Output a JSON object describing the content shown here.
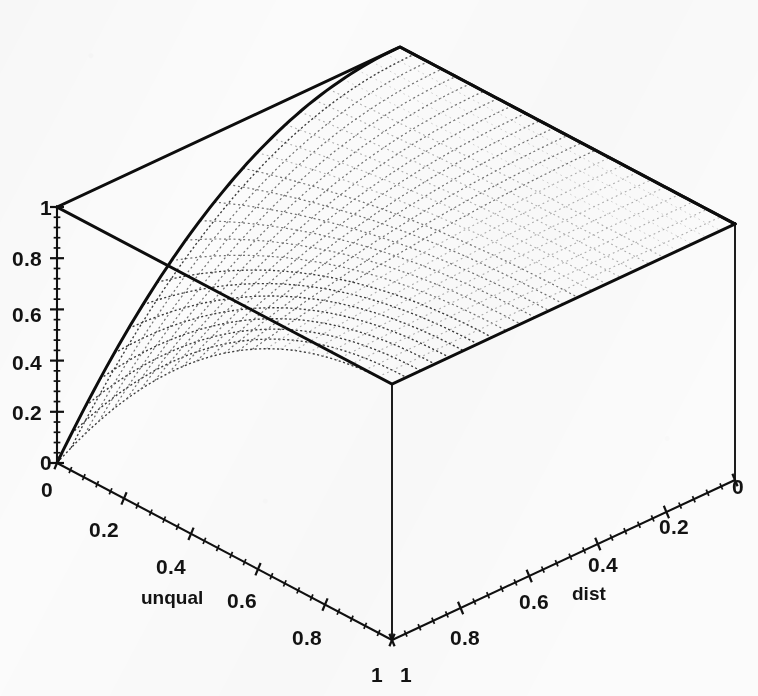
{
  "figure": {
    "kind": "3d-surface-wireframe",
    "background_color": "#fbfbfb",
    "ink_color": "#101010",
    "mesh_color": "#6f6f6f"
  },
  "chart_data": {
    "type": "surface3d",
    "title": "",
    "subtitle": "",
    "xlabel": "unqual",
    "ylabel": "dist",
    "zlabel": "",
    "grid": true,
    "legend": null,
    "legend_position": "none",
    "projection": {
      "note": "isometric-style 3D box, viewed from front above",
      "corner_top_left_px": [
        57,
        207
      ],
      "corner_top_back_px": [
        395,
        13
      ],
      "corner_top_right_px": [
        735,
        152
      ],
      "corner_top_front_px": [
        392,
        387
      ],
      "corner_bottom_left_px": [
        57,
        463
      ],
      "corner_bottom_front_px": [
        392,
        640
      ],
      "corner_bottom_right_px": [
        735,
        480
      ]
    },
    "axes": {
      "x": {
        "name": "unqual",
        "range": [
          0,
          1
        ],
        "ticks": [
          0,
          0.2,
          0.4,
          0.6,
          0.8,
          1
        ],
        "ticklabels": [
          "0",
          "0.2",
          "0.4",
          "0.6",
          "0.8",
          "1"
        ],
        "minor_ticks_per_interval": 5,
        "direction": "front-left descending"
      },
      "y": {
        "name": "dist",
        "range": [
          0,
          1
        ],
        "ticks": [
          0,
          0.2,
          0.4,
          0.6,
          0.8,
          1
        ],
        "ticklabels": [
          "0",
          "0.2",
          "0.4",
          "0.6",
          "0.8",
          "1"
        ],
        "minor_ticks_per_interval": 5,
        "direction": "front-right descending"
      },
      "z": {
        "name": "",
        "range": [
          0,
          1
        ],
        "ticks": [
          0,
          0.2,
          0.4,
          0.6,
          0.8,
          1
        ],
        "ticklabels": [
          "0",
          "0.2",
          "0.4",
          "0.6",
          "0.8",
          "1"
        ],
        "minor_ticks_per_interval": 5,
        "direction": "vertical left"
      }
    },
    "surface": {
      "description": "Surface rises sharply from 0 near the unqual=0, dist=0 corner and saturates at a plateau of 1 over most of the domain.",
      "zmin": 0,
      "zmax": 1,
      "mesh_rows": 24,
      "mesh_cols": 24,
      "z_at_corners": {
        "unqual0_dist0": 0.0,
        "unqual1_dist0": 1.0,
        "unqual0_dist1": 1.0,
        "unqual1_dist1": 1.0
      },
      "sample_grid_u": [
        0,
        0.125,
        0.25,
        0.375,
        0.5,
        0.625,
        0.75,
        0.875,
        1
      ],
      "sample_grid_v": [
        0,
        0.125,
        0.25,
        0.375,
        0.5,
        0.625,
        0.75,
        0.875,
        1
      ],
      "sample_z": [
        [
          0.0,
          0.39,
          0.63,
          0.78,
          0.87,
          0.93,
          0.96,
          0.99,
          1.0
        ],
        [
          0.39,
          0.63,
          0.78,
          0.87,
          0.92,
          0.96,
          0.98,
          0.99,
          1.0
        ],
        [
          0.63,
          0.78,
          0.87,
          0.92,
          0.95,
          0.97,
          0.99,
          1.0,
          1.0
        ],
        [
          0.78,
          0.87,
          0.92,
          0.95,
          0.97,
          0.98,
          0.99,
          1.0,
          1.0
        ],
        [
          0.87,
          0.92,
          0.95,
          0.97,
          0.98,
          0.99,
          1.0,
          1.0,
          1.0
        ],
        [
          0.93,
          0.96,
          0.97,
          0.98,
          0.99,
          0.99,
          1.0,
          1.0,
          1.0
        ],
        [
          0.96,
          0.98,
          0.99,
          0.99,
          1.0,
          1.0,
          1.0,
          1.0,
          1.0
        ],
        [
          0.99,
          0.99,
          1.0,
          1.0,
          1.0,
          1.0,
          1.0,
          1.0,
          1.0
        ],
        [
          1.0,
          1.0,
          1.0,
          1.0,
          1.0,
          1.0,
          1.0,
          1.0,
          1.0
        ]
      ]
    }
  },
  "labels": {
    "z_axis": [
      {
        "text": "1",
        "x": 40,
        "y": 215
      },
      {
        "text": "0.8",
        "x": 12,
        "y": 266
      },
      {
        "text": "0.6",
        "x": 12,
        "y": 322
      },
      {
        "text": "0.4",
        "x": 12,
        "y": 370
      },
      {
        "text": "0.2",
        "x": 12,
        "y": 420
      },
      {
        "text": "0",
        "x": 40,
        "y": 470
      }
    ],
    "x_axis": [
      {
        "text": "0",
        "x": 41,
        "y": 497
      },
      {
        "text": "0.2",
        "x": 89,
        "y": 537
      },
      {
        "text": "0.4",
        "x": 156,
        "y": 574
      },
      {
        "text": "0.6",
        "x": 227,
        "y": 608
      },
      {
        "text": "0.8",
        "x": 292,
        "y": 645
      },
      {
        "text": "1",
        "x": 371,
        "y": 682
      }
    ],
    "y_axis": [
      {
        "text": "0",
        "x": 732,
        "y": 494
      },
      {
        "text": "0.2",
        "x": 659,
        "y": 534
      },
      {
        "text": "0.4",
        "x": 588,
        "y": 572
      },
      {
        "text": "0.6",
        "x": 519,
        "y": 609
      },
      {
        "text": "0.8",
        "x": 450,
        "y": 645
      },
      {
        "text": "1",
        "x": 400,
        "y": 682
      }
    ],
    "axis_names": [
      {
        "text": "unqual",
        "x": 141,
        "y": 604
      },
      {
        "text": "dist",
        "x": 572,
        "y": 600
      }
    ]
  }
}
